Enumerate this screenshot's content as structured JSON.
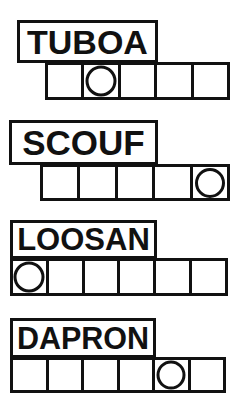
{
  "worksheet": {
    "title": "Word Box Puzzle Worksheet",
    "ink_color": "#111111",
    "paper_color": "#ffffff",
    "rows": [
      {
        "word": "TUBOA",
        "cell_count": 5,
        "circle_index": 1,
        "word_box": {
          "x": 17,
          "y": 20,
          "w": 141,
          "h": 43
        },
        "grid": {
          "x": 45,
          "y": 62,
          "w": 185,
          "h": 38
        },
        "font_size": 34
      },
      {
        "word": "SCOUF",
        "cell_count": 5,
        "circle_index": 4,
        "word_box": {
          "x": 9,
          "y": 120,
          "w": 149,
          "h": 45
        },
        "grid": {
          "x": 40,
          "y": 164,
          "w": 190,
          "h": 37
        },
        "font_size": 35
      },
      {
        "word": "LOOSAN",
        "cell_count": 6,
        "circle_index": 0,
        "word_box": {
          "x": 10,
          "y": 220,
          "w": 147,
          "h": 39
        },
        "grid": {
          "x": 10,
          "y": 258,
          "w": 218,
          "h": 38
        },
        "font_size": 33
      },
      {
        "word": "DAPRON",
        "cell_count": 6,
        "circle_index": 4,
        "word_box": {
          "x": 10,
          "y": 318,
          "w": 146,
          "h": 40
        },
        "grid": {
          "x": 10,
          "y": 357,
          "w": 216,
          "h": 36
        },
        "font_size": 34
      }
    ]
  }
}
